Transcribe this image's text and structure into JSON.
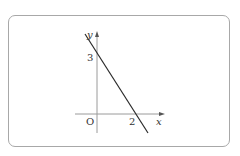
{
  "diagram": {
    "type": "coordinate-graph",
    "axes": {
      "x_label": "x",
      "y_label": "y",
      "origin_label": "O"
    },
    "line": {
      "x_intercept": 2,
      "y_intercept": 3,
      "x_intercept_label": "2",
      "y_intercept_label": "3"
    },
    "colors": {
      "frame": "#a8a8a8",
      "axis": "#9a9a9a",
      "line": "#2a2a2a",
      "text": "#333333"
    }
  }
}
